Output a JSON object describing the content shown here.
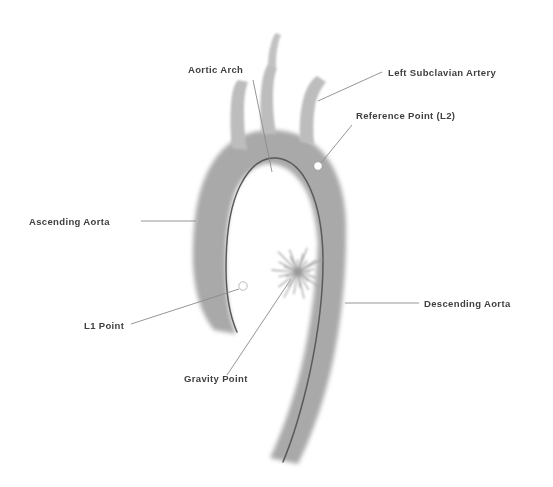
{
  "figure": {
    "background_color": "#ffffff",
    "width": 553,
    "height": 487
  },
  "colors": {
    "vessel_fill": "#a9a9a9",
    "vessel_fill_light": "#bdbdbd",
    "centerline": "#5a5a5a",
    "marker_fill": "#ffffff",
    "leader_line": "#8a8a8a",
    "label_text": "#3f3f3f",
    "starburst": "#9a9a9a"
  },
  "labels": [
    {
      "id": "aortic-arch",
      "text": "Aortic Arch",
      "x": 188,
      "y": 73,
      "anchor": "start"
    },
    {
      "id": "left-subclavian-artery",
      "text": "Left Subclavian Artery",
      "x": 388,
      "y": 76,
      "anchor": "start"
    },
    {
      "id": "reference-point-l2",
      "text": "Reference Point (L2)",
      "x": 356,
      "y": 119,
      "anchor": "start"
    },
    {
      "id": "ascending-aorta",
      "text": "Ascending Aorta",
      "x": 29,
      "y": 225,
      "anchor": "start"
    },
    {
      "id": "descending-aorta",
      "text": "Descending Aorta",
      "x": 424,
      "y": 307,
      "anchor": "start"
    },
    {
      "id": "l1-point",
      "text": "L1 Point",
      "x": 84,
      "y": 329,
      "anchor": "start"
    },
    {
      "id": "gravity-point",
      "text": "Gravity Point",
      "x": 184,
      "y": 382,
      "anchor": "start"
    }
  ],
  "markers": [
    {
      "id": "reference-point-l2-marker",
      "name": "Reference Point (L2)",
      "cx": 318,
      "cy": 166,
      "r": 4.2
    },
    {
      "id": "l1-point-marker",
      "name": "L1 Point",
      "cx": 243,
      "cy": 286,
      "r": 4.2
    }
  ],
  "gravity_point": {
    "id": "gravity-point-marker",
    "name": "Gravity Point",
    "cx": 298,
    "cy": 272,
    "ray_count": 26,
    "ray_length": 26
  },
  "leader_lines": [
    {
      "id": "leader-aortic-arch",
      "x1": 253,
      "y1": 80,
      "x2": 272,
      "y2": 172
    },
    {
      "id": "leader-left-subclavian-artery",
      "x1": 382,
      "y1": 72,
      "x2": 318,
      "y2": 101
    },
    {
      "id": "leader-reference-point-l2",
      "x1": 352,
      "y1": 125,
      "x2": 321,
      "y2": 163
    },
    {
      "id": "leader-ascending-aorta",
      "x1": 141,
      "y1": 221,
      "x2": 196,
      "y2": 221
    },
    {
      "id": "leader-descending-aorta",
      "x1": 419,
      "y1": 303,
      "x2": 345,
      "y2": 303
    },
    {
      "id": "leader-l1-point",
      "x1": 131,
      "y1": 324,
      "x2": 239,
      "y2": 289
    },
    {
      "id": "leader-gravity-point",
      "x1": 227,
      "y1": 375,
      "x2": 291,
      "y2": 279
    }
  ],
  "vessel_paths": {
    "ascending_and_arch": "M 214 330 C 196 308 192 276 193 246 C 194 212 199 184 213 162 C 227 140 248 130 272 130 C 296 130 317 141 330 162 C 341 180 345 200 346 222 L 346 240 L 318 244 C 316 220 312 198 302 184 C 292 169 279 163 268 164 C 254 165 241 176 234 196 C 227 217 225 248 226 278 C 227 300 230 318 236 334 Z",
    "descending": "M 318 240 L 346 240 C 346 272 342 316 334 356 C 326 396 312 436 298 464 L 270 458 C 284 428 297 390 305 350 C 313 310 317 272 318 240 Z",
    "branch_left": "M 232 148 C 230 132 230 118 231 104 C 232 92 234 84 238 80 L 248 82 C 245 90 244 100 244 112 C 244 124 245 138 247 150 Z",
    "branch_mid_lower": "M 262 134 C 260 118 260 104 261 92 C 262 80 264 70 268 64 L 277 68 C 274 76 273 86 273 98 C 273 110 274 122 276 134 Z",
    "branch_mid_thin": "M 268 66 C 268 58 269 50 271 44 C 272 39 274 35 276 33 L 281 35 C 279 39 278 44 277 50 C 276 56 276 62 276 68 Z",
    "branch_right": "M 300 142 C 299 126 300 112 303 100 C 306 88 311 80 317 76 L 326 82 C 321 88 317 96 315 106 C 313 118 313 130 314 144 Z"
  },
  "centerline_path": "M 237 332 C 229 314 226 292 226 268 C 226 236 230 206 240 186 C 250 166 263 157 276 158 C 290 159 302 170 310 188 C 319 208 323 234 323 262 C 323 296 318 334 310 372 C 303 404 293 438 283 462"
}
